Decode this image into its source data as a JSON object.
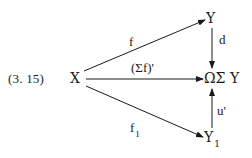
{
  "equation_number": "(3. 15)",
  "nodes": {
    "x": "X",
    "y": "Y",
    "omega_sigma_y": "ΩΣ Y",
    "y1": "Y",
    "y1_sub": "1"
  },
  "arrows": {
    "x_to_y": "f",
    "x_to_omega": "(Σf)'",
    "x_to_y1": "f",
    "x_to_y1_sub": "1",
    "y_to_omega": "d",
    "y1_to_omega": "u'"
  },
  "colors": {
    "ink": "#1a1a1a",
    "background": "#ffffff"
  }
}
